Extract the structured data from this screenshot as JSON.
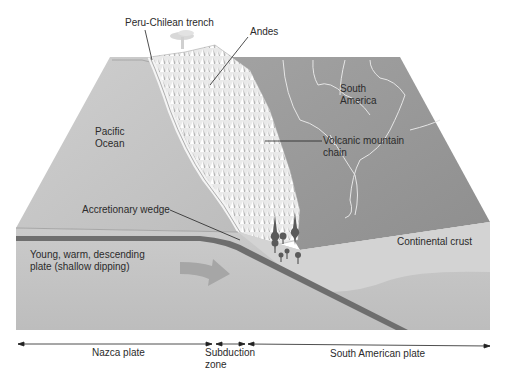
{
  "labels": {
    "trench": "Peru-Chilean trench",
    "andes": "Andes",
    "south_america": [
      "South",
      "America"
    ],
    "pacific_ocean": [
      "Pacific",
      "Ocean"
    ],
    "volcanic_chain": [
      "Volcanic mountain",
      "chain"
    ],
    "accretionary_wedge": "Accretionary wedge",
    "continental_crust": "Continental crust",
    "descending_plate": [
      "Young, warm, descending",
      "plate (shallow dipping)"
    ]
  },
  "plate_extents": [
    {
      "name": "Nazca plate",
      "from_x": 18,
      "to_x": 212
    },
    {
      "name": [
        "Subduction",
        "zone"
      ],
      "from_x": 216,
      "to_x": 245
    },
    {
      "name": "South American plate",
      "from_x": 248,
      "to_x": 490
    }
  ],
  "colors": {
    "background": "#ffffff",
    "ocean_top": "#c9c9c9",
    "land_top": "#9a9a9a",
    "mountains": "#e6e6e6",
    "front_face": "#c4c4c4",
    "continental_crust": "#d0d0d0",
    "slab": "#6e6e6e",
    "arrow": "#a8a8a8",
    "magma": "#5a5a5a",
    "text": "#2b2b2b"
  }
}
